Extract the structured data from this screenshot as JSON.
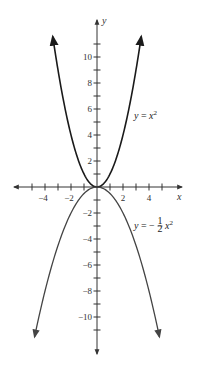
{
  "chart_data": {
    "type": "line",
    "title": "",
    "xlabel": "x",
    "ylabel": "y",
    "xlim": [
      -6.5,
      6.5
    ],
    "ylim": [
      -12.8,
      12.8
    ],
    "grid": false,
    "x_ticks": [
      -5,
      -4,
      -3,
      -2,
      -1,
      1,
      2,
      3,
      4,
      5
    ],
    "x_tick_labels": [
      {
        "value": -4,
        "label": "−4"
      },
      {
        "value": -2,
        "label": "−2"
      },
      {
        "value": 2,
        "label": "2"
      },
      {
        "value": 4,
        "label": "4"
      }
    ],
    "y_ticks": [
      -11,
      -10,
      -9,
      -8,
      -7,
      -6,
      -5,
      -4,
      -3,
      -2,
      -1,
      1,
      2,
      3,
      4,
      5,
      6,
      7,
      8,
      9,
      10,
      11
    ],
    "y_tick_labels": [
      {
        "value": 10,
        "label": "10"
      },
      {
        "value": 8,
        "label": "8"
      },
      {
        "value": 6,
        "label": "6"
      },
      {
        "value": 4,
        "label": "4"
      },
      {
        "value": 2,
        "label": "2"
      },
      {
        "value": -2,
        "label": "−2"
      },
      {
        "value": -4,
        "label": "−4"
      },
      {
        "value": -6,
        "label": "−6"
      },
      {
        "value": -8,
        "label": "−8"
      },
      {
        "value": -10,
        "label": "−10"
      }
    ],
    "series": [
      {
        "name": "y = x^2",
        "equation": "y = x²",
        "x_range": [
          -3.4,
          3.4
        ],
        "x": [
          -3.4,
          -3,
          -2.5,
          -2,
          -1.5,
          -1,
          -0.5,
          0,
          0.5,
          1,
          1.5,
          2,
          2.5,
          3,
          3.4
        ],
        "y": [
          11.56,
          9,
          6.25,
          4,
          2.25,
          1,
          0.25,
          0,
          0.25,
          1,
          2.25,
          4,
          6.25,
          9,
          11.56
        ],
        "color": "#1a1a1a",
        "arrows": true
      },
      {
        "name": "y = -1/2 x^2",
        "equation": "y = −½ x²",
        "x_range": [
          -4.8,
          4.8
        ],
        "x": [
          -4.8,
          -4,
          -3,
          -2,
          -1,
          0,
          1,
          2,
          3,
          4,
          4.8
        ],
        "y": [
          -11.52,
          -8,
          -4.5,
          -2,
          -0.5,
          0,
          -0.5,
          -2,
          -4.5,
          -8,
          -11.52
        ],
        "color": "#444444",
        "arrows": true
      }
    ],
    "annotations": [
      {
        "text": "y = x²",
        "x": 2.2,
        "y": 5.0
      },
      {
        "text": "y = −½ x²",
        "x": 2.2,
        "y": -3.0
      }
    ]
  },
  "labels": {
    "x_axis": "x",
    "y_axis": "y",
    "eq1_prefix": "y",
    "eq1_mid": " = ",
    "eq1_var": "x",
    "eq1_exp": "2",
    "eq2_prefix": "y",
    "eq2_mid": " = −",
    "eq2_num": "1",
    "eq2_den": "2",
    "eq2_var": "x",
    "eq2_exp": "2"
  }
}
